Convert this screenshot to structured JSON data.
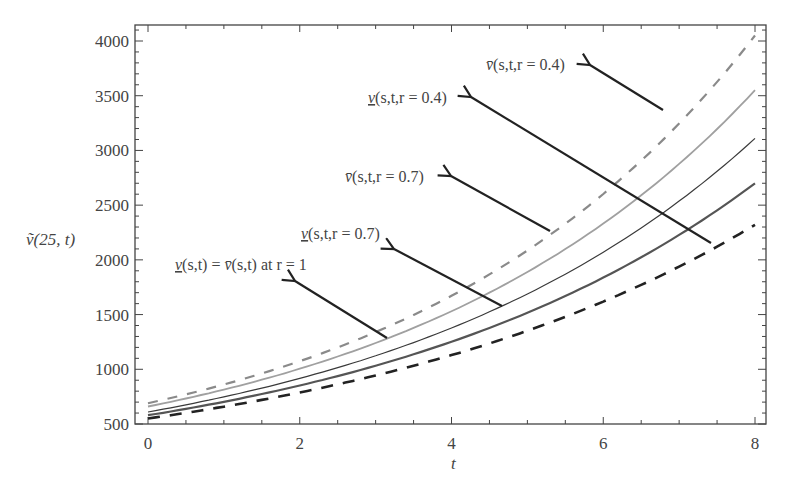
{
  "chart_data": {
    "type": "line",
    "title": "",
    "xlabel": "t",
    "ylabel": "ṽ(25, t)",
    "xlim": [
      0,
      8
    ],
    "ylim": [
      500,
      4100
    ],
    "grid": false,
    "legend": "none (arrow annotations)",
    "x_ticks": [
      0,
      2,
      4,
      6,
      8
    ],
    "y_ticks": [
      500,
      1000,
      1500,
      2000,
      2500,
      3000,
      3500,
      4000
    ],
    "x": [
      0,
      1,
      2,
      3,
      4,
      5,
      6,
      7,
      8
    ],
    "series": [
      {
        "name": "v̄(s,t,r=0.4)",
        "style": "dashed",
        "color": "#8a8a8a",
        "width": 2.2,
        "values": [
          690,
          862,
          1077,
          1346,
          1681,
          2100,
          2624,
          3278,
          4050
        ]
      },
      {
        "name": "v(s,t,r=0.4) (lower)",
        "style": "solid",
        "color": "#a0a0a0",
        "width": 1.8,
        "values": [
          660,
          810,
          994,
          1220,
          1497,
          1837,
          2254,
          2766,
          3550
        ]
      },
      {
        "name": "v̄(s,t,r=0.7)",
        "style": "solid",
        "color": "#3a3a3a",
        "width": 1.2,
        "values": [
          610,
          747,
          914,
          1118,
          1369,
          1676,
          2051,
          2510,
          3110
        ]
      },
      {
        "name": "v(s,t,r=0.7) (lower)",
        "style": "solid",
        "color": "#555555",
        "width": 2.2,
        "values": [
          580,
          703,
          852,
          1033,
          1252,
          1517,
          1838,
          2228,
          2700
        ]
      },
      {
        "name": "v(s,t)=v̄(s,t) at r=1",
        "style": "dashed",
        "color": "#222222",
        "width": 2.6,
        "values": [
          550,
          659,
          790,
          947,
          1135,
          1360,
          1630,
          1953,
          2320
        ]
      }
    ],
    "annotations": [
      {
        "text": "v̄(s,t,r=0.4)",
        "bar": "over",
        "label_x": 486,
        "label_y": 70,
        "arrow_from": [
          663,
          110
        ],
        "arrow_to": [
          590,
          65
        ]
      },
      {
        "text": "v(s,t,r=0.4)",
        "bar": "under",
        "label_x": 368,
        "label_y": 103,
        "arrow_from": [
          711,
          243
        ],
        "arrow_to": [
          471,
          97
        ]
      },
      {
        "text": "v̄(s,t,r=0.7)",
        "bar": "over",
        "label_x": 345,
        "label_y": 182,
        "arrow_from": [
          550,
          231
        ],
        "arrow_to": [
          451,
          176
        ]
      },
      {
        "text": "v(s,t,r=0.7)",
        "bar": "under",
        "label_x": 301,
        "label_y": 239,
        "arrow_from": [
          502,
          306
        ],
        "arrow_to": [
          394,
          249
        ]
      },
      {
        "text": "v(s,t) = v̄(s,t) at r = 1",
        "bar": "mixed",
        "label_x": 175,
        "label_y": 270,
        "arrow_from": [
          387,
          338
        ],
        "arrow_to": [
          295,
          281
        ]
      }
    ]
  },
  "labels": {
    "ylabel": "ṽ(25, t)",
    "xlabel": "t",
    "a1_pre": "v̄",
    "a1_post": "(s,t,r = 0.4)",
    "a2_pre": "v",
    "a2_post": "(s,t,r = 0.4)",
    "a3_pre": "v̄",
    "a3_post": "(s,t,r = 0.7)",
    "a4_pre": "v",
    "a4_post": "(s,t,r = 0.7)",
    "a5_pre": "v",
    "a5_mid": "(s,t) = ",
    "a5_pre2": "v̄",
    "a5_post": "(s,t) at r = 1"
  }
}
